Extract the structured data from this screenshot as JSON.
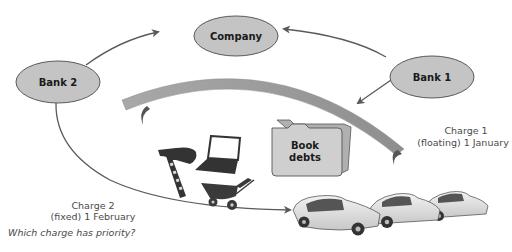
{
  "diagram": {
    "nodes": {
      "company": {
        "label": "Company"
      },
      "bank1": {
        "label": "Bank 1"
      },
      "bank2": {
        "label": "Bank 2"
      }
    },
    "folder": {
      "line1": "Book",
      "line2": "debts"
    },
    "charges": {
      "charge1": {
        "line1": "Charge 1",
        "line2": "(floating) 1 January"
      },
      "charge2": {
        "line1": "Charge 2",
        "line2": "(fixed) 1 February"
      }
    },
    "question": "Which charge has priority?",
    "assets": [
      "nail-gun",
      "laptop",
      "wheelbarrow",
      "book-debts-folder",
      "cars"
    ],
    "colors": {
      "node_fill": "#c4c4c4",
      "node_stroke": "#5a5a5a",
      "arrow": "#5a5a5a",
      "band": "#9a9a9a",
      "text": "#1a1a1a",
      "caption": "#4a4a4a"
    }
  }
}
